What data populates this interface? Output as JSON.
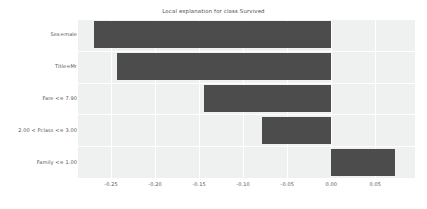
{
  "chart_data": {
    "type": "bar",
    "orientation": "horizontal",
    "title": "Local explanation for class Survived",
    "xlabel": "",
    "ylabel": "",
    "categories": [
      "Sex=male",
      "Title=Mr",
      "Fare <= 7.90",
      "2.00 < Pclass <= 3.00",
      "Family <= 1.00"
    ],
    "values": [
      -0.269,
      -0.243,
      -0.145,
      -0.079,
      0.072
    ],
    "xticks": [
      "-0.25",
      "-0.20",
      "-0.15",
      "-0.10",
      "-0.05",
      "0.00",
      "0.05"
    ],
    "xtick_values": [
      -0.25,
      -0.2,
      -0.15,
      -0.1,
      -0.05,
      0.0,
      0.05
    ],
    "xlim": [
      -0.2875,
      0.095
    ],
    "grid": true,
    "legend": "none",
    "bar_color": "#4c4c4c",
    "plot_background": "#eff0f0",
    "gridline_color": "#ffffff",
    "text_color": "#555555",
    "figure_background": "#ffffff"
  }
}
